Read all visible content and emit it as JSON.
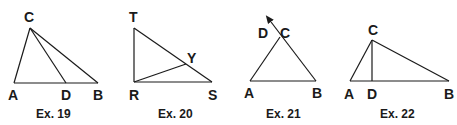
{
  "figures": [
    {
      "caption": "Ex. 19",
      "labels": {
        "C": "C",
        "A": "A",
        "D": "D",
        "B": "B"
      }
    },
    {
      "caption": "Ex. 20",
      "labels": {
        "T": "T",
        "Y": "Y",
        "R": "R",
        "S": "S"
      }
    },
    {
      "caption": "Ex. 21",
      "labels": {
        "D": "D",
        "C": "C",
        "A": "A",
        "B": "B"
      }
    },
    {
      "caption": "Ex. 22",
      "labels": {
        "C": "C",
        "A": "A",
        "D": "D",
        "B": "B"
      }
    }
  ],
  "colors": {
    "ink": "#1a1a1a",
    "background": "#ffffff"
  }
}
